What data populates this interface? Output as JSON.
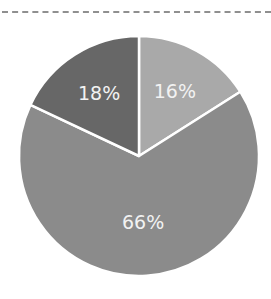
{
  "chart_data": {
    "type": "pie",
    "title": "",
    "categories": [
      "Slice A",
      "Slice B",
      "Slice C"
    ],
    "values": [
      16,
      66,
      18
    ],
    "labels": [
      "16%",
      "66%",
      "18%"
    ],
    "colors": [
      "#a9a9a9",
      "#8b8b8b",
      "#676767"
    ],
    "start_angle": "12 o'clock, clockwise",
    "legend": "none",
    "separator_color": "#ffffff"
  },
  "decor": {
    "top_rule": "dashed",
    "rule_color": "#8f8f8f"
  }
}
